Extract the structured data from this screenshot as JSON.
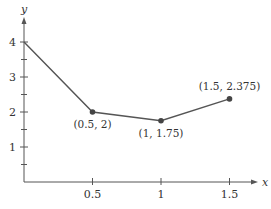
{
  "chart_data": {
    "type": "line",
    "title": "",
    "xlabel": "x",
    "ylabel": "y",
    "xlim": [
      0,
      1.6
    ],
    "ylim": [
      0,
      4.3
    ],
    "grid": false,
    "legend": null,
    "x_ticks": [
      0.5,
      1,
      1.5
    ],
    "x_tick_labels": [
      "0.5",
      "1",
      "1.5"
    ],
    "y_ticks": [
      1,
      2,
      3,
      4
    ],
    "y_tick_labels": [
      "1",
      "2",
      "3",
      "4"
    ],
    "y_minor_ticks": [
      0.5,
      1.5,
      2.5,
      3.5
    ],
    "series": [
      {
        "name": "polyline",
        "x": [
          0,
          0.5,
          1,
          1.5
        ],
        "y": [
          4,
          2,
          1.75,
          2.375
        ],
        "markers": [
          false,
          true,
          true,
          true
        ]
      }
    ],
    "annotations": [
      {
        "text": "(0.5, 2)",
        "x": 0.5,
        "y": 2,
        "position": "below"
      },
      {
        "text": "(1, 1.75)",
        "x": 1,
        "y": 1.75,
        "position": "below"
      },
      {
        "text": "(1.5, 2.375)",
        "x": 1.5,
        "y": 2.375,
        "position": "above"
      }
    ],
    "colors": {
      "line": "#555555",
      "axis": "#555555",
      "text": "#333333"
    }
  }
}
